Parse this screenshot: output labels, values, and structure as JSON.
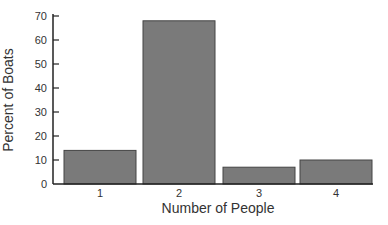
{
  "chart_data": {
    "type": "bar",
    "title": "",
    "xlabel": "Number of People",
    "ylabel": "Percent of Boats",
    "categories": [
      "1",
      "2",
      "3",
      "4"
    ],
    "values": [
      14,
      68,
      7,
      10
    ],
    "ylim": [
      0,
      70
    ],
    "yticks": [
      0,
      10,
      20,
      30,
      40,
      50,
      60,
      70
    ],
    "grid": false,
    "legend": null,
    "bar_color": "#7a7a7a",
    "bar_edge_color": "#444444"
  }
}
